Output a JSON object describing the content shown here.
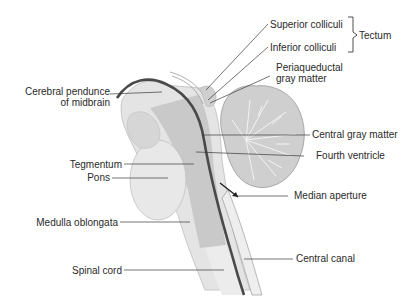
{
  "diagram": {
    "labels_left": {
      "cerebral_peduncle_line1": "Cerebral pendunce",
      "cerebral_peduncle_line1_full": "Cerebral pendunce",
      "cerebral_peduncle_line2": "of midbrain",
      "tegmentum": "Tegmentum",
      "pons": "Pons",
      "medulla": "Medulla oblongata",
      "spinal_cord": "Spinal cord"
    },
    "labels_right": {
      "superior_colliculi": "Superior colliculi",
      "inferior_colliculi": "Inferior colliculi",
      "tectum": "Tectum",
      "periaqueductal_line1": "Periaqueductal",
      "periaqueductal_line2": "gray matter",
      "central_gray_matter": "Central gray matter",
      "fourth_ventricle": "Fourth ventricle",
      "median_aperture": "Median aperture",
      "central_canal": "Central canal"
    },
    "colors": {
      "light_tissue": "#e4e4e4",
      "mid_tissue": "#c9c9c9",
      "dark_line": "#4a4a4a",
      "cerebellum": "#cfcfcf",
      "leader_line": "#3a3a3a"
    }
  }
}
